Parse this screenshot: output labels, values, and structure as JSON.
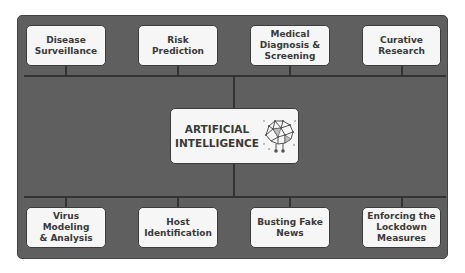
{
  "diagram": {
    "center": {
      "line1": "ARTIFICIAL",
      "line2": "INTELLIGENCE",
      "icon": "brain-network-icon"
    },
    "top_nodes": [
      {
        "lines": [
          "Disease",
          "Surveillance"
        ]
      },
      {
        "lines": [
          "Risk",
          "Prediction"
        ]
      },
      {
        "lines": [
          "Medical",
          "Diagnosis &",
          "Screening"
        ]
      },
      {
        "lines": [
          "Curative",
          "Research"
        ]
      }
    ],
    "bottom_nodes": [
      {
        "lines": [
          "Virus Modeling",
          "& Analysis"
        ]
      },
      {
        "lines": [
          "Host",
          "Identification"
        ]
      },
      {
        "lines": [
          "Busting Fake",
          "News"
        ]
      },
      {
        "lines": [
          "Enforcing the",
          "Lockdown",
          "Measures"
        ]
      }
    ],
    "colors": {
      "panel": "#5f5f5f",
      "box": "#f6f6f6",
      "line": "#333333",
      "text": "#3a3a3a"
    }
  }
}
